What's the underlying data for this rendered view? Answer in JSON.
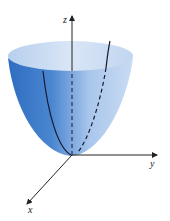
{
  "diagram": {
    "type": "3d-surface",
    "surface": "elliptic paraboloid",
    "colors": {
      "surface_dark": "#2f6fc2",
      "surface_light": "#cfe0f4",
      "rim_inner": "#d6e4f5",
      "axis": "#222222",
      "trace": "#1a1a2e"
    },
    "axes": {
      "z": {
        "label": "z"
      },
      "y": {
        "label": "y"
      },
      "x": {
        "label": "x"
      }
    }
  }
}
